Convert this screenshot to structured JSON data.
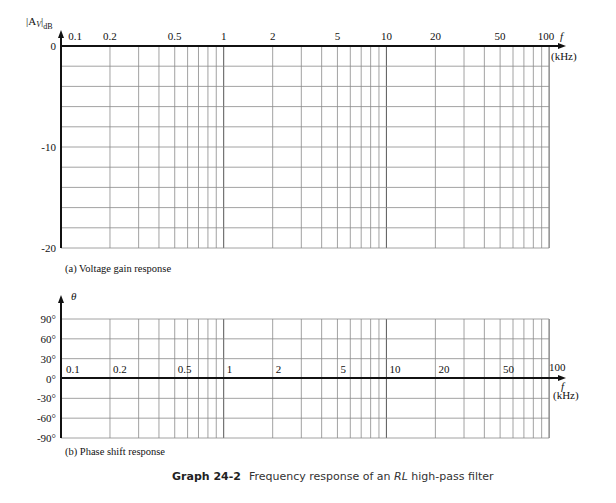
{
  "chart_data": [
    {
      "type": "line",
      "title": "(a) Voltage gain response",
      "xlabel": "f (kHz)",
      "ylabel": "|Av|dB",
      "xscale": "log",
      "xlim": [
        0.1,
        100
      ],
      "ylim": [
        -20,
        0
      ],
      "x_tick_labels": [
        "0.1",
        "0.2",
        "0.5",
        "1",
        "2",
        "5",
        "10",
        "20",
        "50",
        "100"
      ],
      "y_tick_labels": [
        "0",
        "-10",
        "-20"
      ],
      "y_grid_step": 2,
      "grid": true,
      "series": []
    },
    {
      "type": "line",
      "title": "(b) Phase shift response",
      "xlabel": "f (kHz)",
      "ylabel": "θ",
      "xscale": "log",
      "xlim": [
        0.1,
        100
      ],
      "ylim": [
        -90,
        90
      ],
      "x_tick_labels": [
        "0.1",
        "0.2",
        "0.5",
        "1",
        "2",
        "5",
        "10",
        "20",
        "50",
        "100"
      ],
      "y_tick_labels": [
        "90°",
        "60°",
        "30°",
        "0°",
        "-30°",
        "-60°",
        "-90°"
      ],
      "y_grid_step": 30,
      "grid": true,
      "series": []
    }
  ],
  "gain": {
    "ylabel_main": "|A",
    "ylabel_sub": "V",
    "ylabel_end": "|",
    "ylabel_db": "dB",
    "y_ticks": [
      {
        "v": 0,
        "label": "0"
      },
      {
        "v": -10,
        "label": "-10"
      },
      {
        "v": -20,
        "label": "-20"
      }
    ],
    "x_labels": [
      "0.1",
      "0.2",
      "0.5",
      "1",
      "2",
      "5",
      "10",
      "20",
      "50",
      "100"
    ],
    "f_label": "f",
    "unit_label": "(kHz)",
    "caption": "(a) Voltage gain response"
  },
  "phase": {
    "ylabel": "θ",
    "y_ticks": [
      {
        "v": 90,
        "label": "90°"
      },
      {
        "v": 60,
        "label": "60°"
      },
      {
        "v": 30,
        "label": "30°"
      },
      {
        "v": 0,
        "label": "0°"
      },
      {
        "v": -30,
        "label": "-30°"
      },
      {
        "v": -60,
        "label": "-60°"
      },
      {
        "v": -90,
        "label": "-90°"
      }
    ],
    "x_labels": [
      "0.1",
      "0.2",
      "0.5",
      "1",
      "2",
      "5",
      "10",
      "20",
      "50",
      "100"
    ],
    "f_label": "f",
    "unit_label": "(kHz)",
    "caption": "(b) Phase shift response"
  },
  "figure": {
    "number": "Graph 24-2",
    "title_pre": "Frequency response of an ",
    "title_em": "RL",
    "title_post": " high-pass filter"
  }
}
